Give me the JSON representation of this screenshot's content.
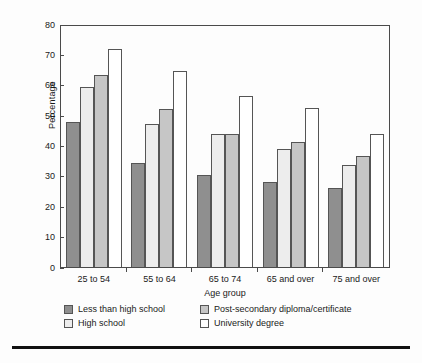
{
  "chart_data": {
    "type": "bar",
    "title": "",
    "xlabel": "Age group",
    "ylabel": "Percentage",
    "ylim": [
      0,
      80
    ],
    "ytick_step": 10,
    "yticks": [
      80,
      70,
      60,
      50,
      40,
      30,
      20,
      10,
      0
    ],
    "grid": false,
    "legend_position": "bottom",
    "categories": [
      "25 to 54",
      "55 to 64",
      "65 to 74",
      "65 and over",
      "75 and over"
    ],
    "series": [
      {
        "name": "Less than high school",
        "color": "#8f8f8f",
        "values": [
          48.0,
          34.5,
          30.4,
          28.3,
          26.1
        ]
      },
      {
        "name": "High school",
        "color": "#ededed",
        "values": [
          59.6,
          47.5,
          44.2,
          39.1,
          34.0
        ]
      },
      {
        "name": "Post-secondary diploma/certificate",
        "color": "#c6c6c6",
        "values": [
          63.6,
          52.6,
          44.3,
          41.5,
          36.7
        ]
      },
      {
        "name": "University degree",
        "color": "#ffffff",
        "values": [
          72.4,
          65.2,
          56.8,
          52.8,
          44.3
        ]
      }
    ]
  },
  "axis": {
    "y_label": "Percentage",
    "x_label": "Age group",
    "y_ticks": [
      "80",
      "70",
      "60",
      "50",
      "40",
      "30",
      "20",
      "10",
      "0"
    ],
    "x_ticks": [
      "25 to 54",
      "55 to 64",
      "65 to 74",
      "65 and over",
      "75 and over"
    ]
  },
  "legend": {
    "items": [
      {
        "label": "Less than high school",
        "color": "#8f8f8f"
      },
      {
        "label": "Post-secondary diploma/certificate",
        "color": "#c6c6c6"
      },
      {
        "label": "High school",
        "color": "#ededed"
      },
      {
        "label": "University degree",
        "color": "#ffffff"
      }
    ]
  },
  "colors": {
    "axis": "#4a4a4a",
    "bar_outline": "#555555",
    "background": "#fdfdfd",
    "rule": "#111111"
  }
}
